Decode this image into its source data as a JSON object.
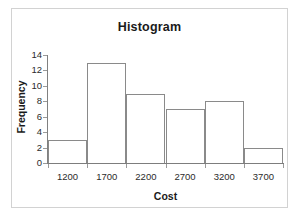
{
  "chart_data": {
    "type": "bar",
    "title": "Histogram",
    "xlabel": "Cost",
    "ylabel": "Frequency",
    "categories": [
      "1200",
      "1700",
      "2200",
      "2700",
      "3200",
      "3700"
    ],
    "values": [
      3,
      13,
      9,
      7,
      8,
      2
    ],
    "ylim": [
      0,
      14
    ],
    "yticks": [
      0,
      2,
      4,
      6,
      8,
      10,
      12,
      14
    ],
    "ytick_labels": [
      "0",
      "2",
      "4",
      "6",
      "8",
      "10",
      "12",
      "14"
    ],
    "xtick_labels": [
      "1200",
      "1700",
      "2200",
      "2700",
      "3200",
      "3700"
    ],
    "grid": false,
    "legend": "none",
    "bar_fill_color": "#ffffff",
    "bar_edge_color": "#8a8a8a",
    "axis_color": "#808080",
    "text_color": "#1a1a1a",
    "frame_color": "#d2d2d2"
  }
}
